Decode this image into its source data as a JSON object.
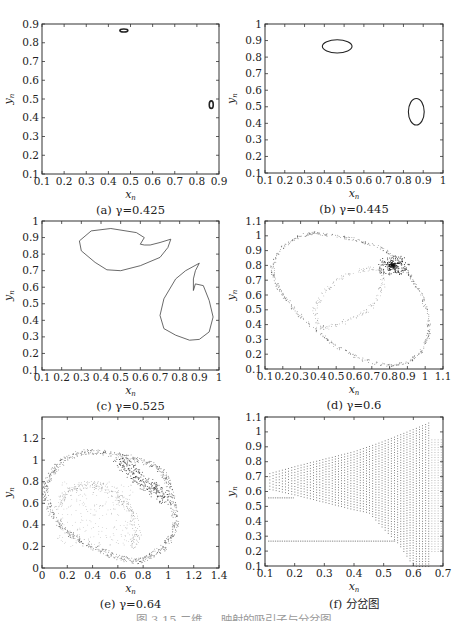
{
  "figure_caption": "图 3.15  二维 ...  映射的吸引子与分岔图",
  "chart_data": [
    {
      "id": "a",
      "type": "scatter",
      "title": "(a) γ=0.425",
      "xlabel": "x_n",
      "ylabel": "y_n",
      "xlim": [
        0.1,
        0.9
      ],
      "ylim": [
        0.1,
        0.9
      ],
      "xticks": [
        "0.1",
        "0.2",
        "0.3",
        "0.4",
        "0.5",
        "0.6",
        "0.7",
        "0.8",
        "0.9"
      ],
      "yticks": [
        "0.1",
        "0.2",
        "0.3",
        "0.4",
        "0.5",
        "0.6",
        "0.7",
        "0.8",
        "0.9"
      ],
      "frame": {
        "x": 42,
        "y": 24,
        "w": 177,
        "h": 150
      },
      "description": "Two small closed loops (period-2 quasi-periodic)",
      "loops": [
        {
          "cx": 0.47,
          "cy": 0.865,
          "rx": 0.018,
          "ry": 0.008
        },
        {
          "cx": 0.865,
          "cy": 0.47,
          "rx": 0.009,
          "ry": 0.02
        }
      ]
    },
    {
      "id": "b",
      "type": "scatter",
      "title": "(b) γ=0.445",
      "xlabel": "x_n",
      "ylabel": "y_n",
      "xlim": [
        0.1,
        1.0
      ],
      "ylim": [
        0.1,
        1.0
      ],
      "xticks": [
        "0.1",
        "0.2",
        "0.3",
        "0.4",
        "0.5",
        "0.6",
        "0.7",
        "0.8",
        "0.9",
        "1"
      ],
      "yticks": [
        "0.1",
        "0.2",
        "0.3",
        "0.4",
        "0.5",
        "0.6",
        "0.7",
        "0.8",
        "0.9",
        "1"
      ],
      "frame": {
        "x": 265,
        "y": 24,
        "w": 178,
        "h": 149
      },
      "description": "Two closed invariant curves",
      "loops": [
        {
          "cx": 0.465,
          "cy": 0.865,
          "rx": 0.075,
          "ry": 0.04
        },
        {
          "cx": 0.865,
          "cy": 0.47,
          "rx": 0.04,
          "ry": 0.08
        }
      ]
    },
    {
      "id": "c",
      "type": "scatter",
      "title": "(c) γ=0.525",
      "xlabel": "x_n",
      "ylabel": "y_n",
      "xlim": [
        0.1,
        1.0
      ],
      "ylim": [
        0.1,
        1.0
      ],
      "xticks": [
        "0.1",
        "0.2",
        "0.3",
        "0.4",
        "0.5",
        "0.6",
        "0.7",
        "0.8",
        "0.9",
        "1"
      ],
      "yticks": [
        "0.1",
        "0.2",
        "0.3",
        "0.4",
        "0.5",
        "0.6",
        "0.7",
        "0.8",
        "0.9",
        "1"
      ],
      "frame": {
        "x": 42,
        "y": 221,
        "w": 177,
        "h": 149
      },
      "description": "Two folded invariant curves with cusps",
      "curves": [
        [
          [
            0.6,
            0.86
          ],
          [
            0.62,
            0.9
          ],
          [
            0.58,
            0.93
          ],
          [
            0.45,
            0.955
          ],
          [
            0.35,
            0.94
          ],
          [
            0.29,
            0.88
          ],
          [
            0.3,
            0.82
          ],
          [
            0.37,
            0.75
          ],
          [
            0.43,
            0.705
          ],
          [
            0.5,
            0.7
          ],
          [
            0.6,
            0.73
          ],
          [
            0.7,
            0.78
          ],
          [
            0.74,
            0.84
          ],
          [
            0.755,
            0.89
          ],
          [
            0.7,
            0.87
          ],
          [
            0.65,
            0.855
          ],
          [
            0.62,
            0.855
          ],
          [
            0.6,
            0.86
          ]
        ],
        [
          [
            0.87,
            0.58
          ],
          [
            0.88,
            0.62
          ],
          [
            0.92,
            0.61
          ],
          [
            0.95,
            0.52
          ],
          [
            0.97,
            0.42
          ],
          [
            0.95,
            0.33
          ],
          [
            0.9,
            0.285
          ],
          [
            0.85,
            0.28
          ],
          [
            0.78,
            0.31
          ],
          [
            0.72,
            0.35
          ],
          [
            0.7,
            0.43
          ],
          [
            0.72,
            0.53
          ],
          [
            0.78,
            0.65
          ],
          [
            0.83,
            0.7
          ],
          [
            0.9,
            0.745
          ],
          [
            0.88,
            0.7
          ],
          [
            0.87,
            0.65
          ],
          [
            0.87,
            0.58
          ]
        ]
      ]
    },
    {
      "id": "d",
      "type": "scatter",
      "title": "(d) γ=0.6",
      "xlabel": "x_n",
      "ylabel": "y_n",
      "xlim": [
        0.1,
        1.1
      ],
      "ylim": [
        0.1,
        1.1
      ],
      "xticks": [
        "0.1",
        "0.2",
        "0.3",
        "0.4",
        "0.5",
        "0.6",
        "0.7",
        "0.8",
        "0.9",
        "1",
        "1.1"
      ],
      "yticks": [
        "0.1",
        "0.2",
        "0.3",
        "0.4",
        "0.5",
        "0.6",
        "0.7",
        "0.8",
        "0.9",
        "1",
        "1.1"
      ],
      "frame": {
        "x": 265,
        "y": 221,
        "w": 178,
        "h": 148
      },
      "description": "Chaotic attractor: large outer loop with inner arc and dense cluster near (0.82, 0.8)",
      "outer": [
        [
          0.14,
          0.8
        ],
        [
          0.2,
          0.93
        ],
        [
          0.3,
          1.0
        ],
        [
          0.38,
          1.02
        ],
        [
          0.5,
          1.0
        ],
        [
          0.62,
          0.97
        ],
        [
          0.75,
          0.92
        ],
        [
          0.85,
          0.84
        ],
        [
          0.92,
          0.72
        ],
        [
          0.98,
          0.6
        ],
        [
          1.02,
          0.45
        ],
        [
          1.02,
          0.33
        ],
        [
          0.98,
          0.22
        ],
        [
          0.9,
          0.14
        ],
        [
          0.8,
          0.12
        ],
        [
          0.65,
          0.16
        ],
        [
          0.5,
          0.25
        ],
        [
          0.4,
          0.35
        ],
        [
          0.28,
          0.48
        ],
        [
          0.2,
          0.6
        ],
        [
          0.15,
          0.7
        ],
        [
          0.14,
          0.8
        ]
      ],
      "inner": [
        [
          0.4,
          0.38
        ],
        [
          0.38,
          0.5
        ],
        [
          0.42,
          0.6
        ],
        [
          0.5,
          0.7
        ],
        [
          0.6,
          0.76
        ],
        [
          0.7,
          0.78
        ],
        [
          0.76,
          0.76
        ],
        [
          0.76,
          0.66
        ],
        [
          0.72,
          0.55
        ],
        [
          0.65,
          0.47
        ],
        [
          0.55,
          0.42
        ],
        [
          0.45,
          0.38
        ],
        [
          0.4,
          0.38
        ]
      ],
      "cluster": {
        "x": 0.82,
        "y": 0.8
      }
    },
    {
      "id": "e",
      "type": "scatter",
      "title": "(e) γ=0.64",
      "xlabel": "x_n",
      "ylabel": "y_n",
      "xlim": [
        0,
        1.4
      ],
      "ylim": [
        0,
        1.4
      ],
      "xticks": [
        "0",
        "0.2",
        "0.4",
        "0.6",
        "0.8",
        "1",
        "1.2",
        "1.4"
      ],
      "yticks": [
        "0",
        "0.2",
        "0.4",
        "0.6",
        "0.8",
        "1",
        "1.2"
      ],
      "frame": {
        "x": 42,
        "y": 417,
        "w": 177,
        "h": 151
      },
      "description": "Chaotic attractor with thick band in upper right",
      "outer": [
        [
          0.03,
          0.8
        ],
        [
          0.1,
          0.92
        ],
        [
          0.2,
          1.02
        ],
        [
          0.35,
          1.08
        ],
        [
          0.5,
          1.07
        ],
        [
          0.7,
          1.02
        ],
        [
          0.85,
          0.97
        ],
        [
          0.95,
          0.9
        ],
        [
          1.0,
          0.78
        ],
        [
          1.04,
          0.6
        ],
        [
          1.06,
          0.42
        ],
        [
          1.02,
          0.28
        ],
        [
          0.95,
          0.18
        ],
        [
          0.85,
          0.1
        ],
        [
          0.75,
          0.06
        ],
        [
          0.6,
          0.1
        ],
        [
          0.45,
          0.17
        ],
        [
          0.3,
          0.25
        ],
        [
          0.18,
          0.35
        ],
        [
          0.08,
          0.5
        ],
        [
          0.03,
          0.65
        ],
        [
          0.03,
          0.8
        ]
      ],
      "inner": [
        [
          0.12,
          0.55
        ],
        [
          0.2,
          0.7
        ],
        [
          0.3,
          0.76
        ],
        [
          0.42,
          0.77
        ],
        [
          0.55,
          0.72
        ],
        [
          0.65,
          0.63
        ],
        [
          0.72,
          0.5
        ],
        [
          0.75,
          0.3
        ],
        [
          0.72,
          0.2
        ]
      ],
      "band": [
        [
          0.6,
          1.03
        ],
        [
          0.7,
          0.9
        ],
        [
          0.8,
          0.8
        ],
        [
          0.9,
          0.72
        ],
        [
          1.0,
          0.62
        ]
      ]
    },
    {
      "id": "f",
      "type": "scatter",
      "title": "(f) 分岔图",
      "xlabel": "x_n",
      "ylabel": "y_n",
      "xlim": [
        0.1,
        0.7
      ],
      "ylim": [
        0.1,
        1.1
      ],
      "xticks": [
        "0.1",
        "0.2",
        "0.3",
        "0.4",
        "0.5",
        "0.6",
        "0.7"
      ],
      "yticks": [
        "0.1",
        "0.2",
        "0.3",
        "0.4",
        "0.5",
        "0.6",
        "0.7",
        "0.8",
        "0.9",
        "1",
        "1.1"
      ],
      "frame": {
        "x": 265,
        "y": 417,
        "w": 178,
        "h": 149
      },
      "description": "Bifurcation diagram: fan of vertical dotted columns widening from ~0.65 at x=0.1 to 0.1–1.07 near x=0.65, plus horizontal dotted line at y≈0.27 and y≈0.56",
      "upper_envelope": [
        [
          0.11,
          0.72
        ],
        [
          0.2,
          0.77
        ],
        [
          0.3,
          0.82
        ],
        [
          0.4,
          0.87
        ],
        [
          0.5,
          0.94
        ],
        [
          0.6,
          1.02
        ],
        [
          0.66,
          1.07
        ]
      ],
      "lower_envelope": [
        [
          0.11,
          0.62
        ],
        [
          0.2,
          0.58
        ],
        [
          0.3,
          0.53
        ],
        [
          0.4,
          0.48
        ],
        [
          0.45,
          0.46
        ],
        [
          0.5,
          0.35
        ],
        [
          0.55,
          0.25
        ],
        [
          0.6,
          0.1
        ],
        [
          0.66,
          0.1
        ]
      ],
      "hlines": [
        0.27,
        0.56
      ]
    }
  ]
}
